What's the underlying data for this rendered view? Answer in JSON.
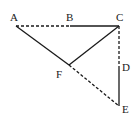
{
  "diagram": {
    "points": {
      "A": {
        "label": "A",
        "x": 16,
        "y": 26
      },
      "B": {
        "label": "B",
        "x": 70,
        "y": 26
      },
      "C": {
        "label": "C",
        "x": 119,
        "y": 26
      },
      "D": {
        "label": "D",
        "x": 119,
        "y": 66
      },
      "E": {
        "label": "E",
        "x": 119,
        "y": 106
      },
      "F": {
        "label": "F",
        "x": 69,
        "y": 65
      }
    },
    "segments": [
      {
        "from": "A",
        "to": "B",
        "style": "dashed"
      },
      {
        "from": "B",
        "to": "C",
        "style": "solid"
      },
      {
        "from": "C",
        "to": "D",
        "style": "dashed"
      },
      {
        "from": "D",
        "to": "E",
        "style": "solid"
      },
      {
        "from": "A",
        "to": "F",
        "style": "solid"
      },
      {
        "from": "F",
        "to": "C",
        "style": "solid"
      },
      {
        "from": "F",
        "to": "E",
        "style": "dashed"
      }
    ]
  }
}
